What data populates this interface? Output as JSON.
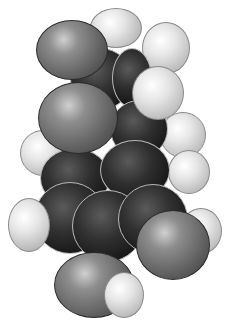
{
  "image": {
    "subject": "space-filling molecular model",
    "atom_types": [
      "hydrogen",
      "carbon",
      "oxygen"
    ],
    "colors": {
      "hydrogen": "#e6e6e6",
      "carbon": "#1e1e1e",
      "oxygen": "#7a7a7a",
      "background": "#ffffff"
    }
  }
}
